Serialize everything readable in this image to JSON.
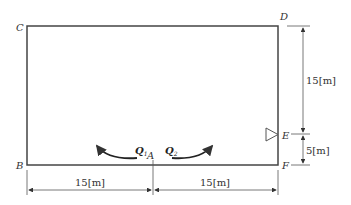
{
  "diagram": {
    "points": {
      "A": "A",
      "B": "B",
      "C": "C",
      "D": "D",
      "E": "E",
      "F": "F"
    },
    "flows": {
      "q1": {
        "symbol": "Q",
        "sub": "1"
      },
      "q2": {
        "symbol": "Q",
        "sub": "2"
      }
    },
    "dimensions": {
      "bottom_left": "15[m]",
      "bottom_right": "15[m]",
      "right_upper": "15[m]",
      "right_lower": "5[m]"
    }
  }
}
